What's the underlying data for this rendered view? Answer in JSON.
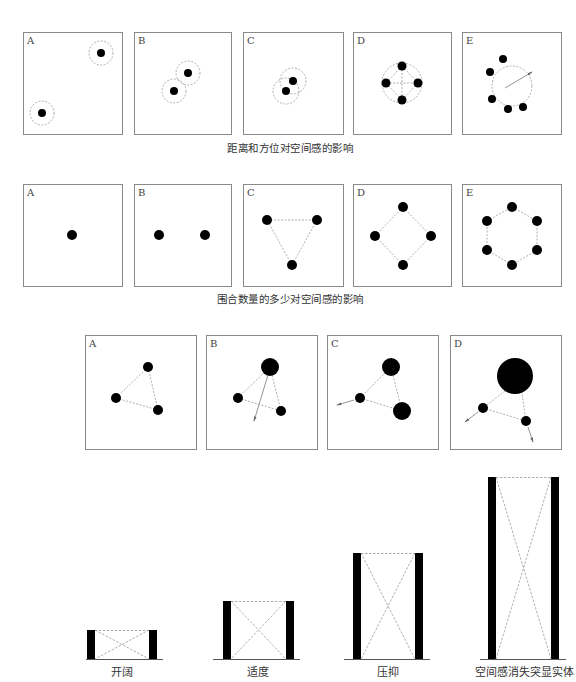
{
  "colors": {
    "frame": "#8a8a8a",
    "dot": "#000000",
    "dashed": "#9a9a9a",
    "text": "#333333"
  },
  "figure1": {
    "caption": "距离和方位对空间感的影响",
    "caption_pos": [
      290,
      147
    ],
    "panels": [
      {
        "label": "A",
        "box": [
          23,
          32,
          99,
          102
        ],
        "dots": [
          [
            101,
            53,
            4
          ],
          [
            42,
            113,
            4
          ]
        ],
        "circles": [
          [
            101,
            53,
            12
          ],
          [
            42,
            113,
            12
          ]
        ],
        "lines": [],
        "arrows": []
      },
      {
        "label": "B",
        "box": [
          134,
          32,
          97,
          102
        ],
        "dots": [
          [
            188,
            73,
            4
          ],
          [
            174,
            91,
            4
          ]
        ],
        "circles": [
          [
            188,
            73,
            12
          ],
          [
            174,
            91,
            12
          ]
        ],
        "lines": [],
        "arrows": []
      },
      {
        "label": "C",
        "box": [
          243,
          32,
          100,
          102
        ],
        "dots": [
          [
            293,
            81,
            4
          ],
          [
            286,
            91,
            4
          ]
        ],
        "circles": [
          [
            293,
            81,
            13
          ],
          [
            286,
            91,
            13
          ]
        ],
        "lines": [],
        "arrows": []
      },
      {
        "label": "D",
        "box": [
          353,
          32,
          98,
          102
        ],
        "dots": [
          [
            402,
            66,
            4.5
          ],
          [
            386,
            83,
            4.5
          ],
          [
            418,
            83,
            4.5
          ],
          [
            402,
            100,
            4.5
          ]
        ],
        "circles": [
          [
            402,
            83,
            20
          ]
        ],
        "lines": [
          [
            386,
            83,
            418,
            83
          ],
          [
            402,
            66,
            402,
            100
          ],
          [
            402,
            66,
            386,
            83
          ],
          [
            402,
            66,
            418,
            83
          ],
          [
            386,
            83,
            402,
            100
          ],
          [
            418,
            83,
            402,
            100
          ]
        ],
        "arrows": []
      },
      {
        "label": "E",
        "box": [
          462,
          32,
          99,
          102
        ],
        "dots": [
          [
            503,
            59,
            4
          ],
          [
            490,
            72,
            4
          ],
          [
            492,
            99,
            4
          ],
          [
            508,
            109,
            4
          ],
          [
            523,
            107,
            4
          ]
        ],
        "circles": [
          [
            512,
            86,
            20
          ]
        ],
        "lines": [],
        "arrows": [
          [
            505,
            88,
            532,
            72
          ]
        ]
      }
    ]
  },
  "figure2": {
    "caption": "围合数量的多少对空间感的影响",
    "caption_pos": [
      290,
      298
    ],
    "panels": [
      {
        "label": "A",
        "box": [
          23,
          184,
          99,
          102
        ],
        "dots": [
          [
            72,
            235,
            5
          ]
        ],
        "circles": [],
        "lines": [],
        "arrows": []
      },
      {
        "label": "B",
        "box": [
          134,
          184,
          97,
          102
        ],
        "dots": [
          [
            159,
            235,
            5
          ],
          [
            205,
            235,
            5
          ]
        ],
        "circles": [],
        "lines": [],
        "arrows": []
      },
      {
        "label": "C",
        "box": [
          243,
          184,
          100,
          102
        ],
        "dots": [
          [
            267,
            220,
            5
          ],
          [
            317,
            220,
            5
          ],
          [
            292,
            265,
            5
          ]
        ],
        "circles": [],
        "lines": [
          [
            267,
            220,
            317,
            220
          ],
          [
            317,
            220,
            292,
            265
          ],
          [
            292,
            265,
            267,
            220
          ]
        ],
        "arrows": []
      },
      {
        "label": "D",
        "box": [
          353,
          184,
          98,
          102
        ],
        "dots": [
          [
            403,
            207,
            5
          ],
          [
            375,
            236,
            5
          ],
          [
            431,
            236,
            5
          ],
          [
            403,
            265,
            5
          ]
        ],
        "circles": [],
        "lines": [
          [
            403,
            207,
            431,
            236
          ],
          [
            431,
            236,
            403,
            265
          ],
          [
            403,
            265,
            375,
            236
          ],
          [
            375,
            236,
            403,
            207
          ]
        ],
        "arrows": []
      },
      {
        "label": "E",
        "box": [
          462,
          184,
          99,
          102
        ],
        "dots": [
          [
            512,
            207,
            5
          ],
          [
            487,
            221,
            5
          ],
          [
            537,
            221,
            5
          ],
          [
            487,
            250,
            5
          ],
          [
            537,
            250,
            5
          ],
          [
            512,
            265,
            5
          ]
        ],
        "circles": [],
        "lines": [
          [
            512,
            207,
            537,
            221
          ],
          [
            537,
            221,
            537,
            250
          ],
          [
            537,
            250,
            512,
            265
          ],
          [
            512,
            265,
            487,
            250
          ],
          [
            487,
            250,
            487,
            221
          ],
          [
            487,
            221,
            512,
            207
          ]
        ],
        "arrows": []
      }
    ]
  },
  "figure3": {
    "panels": [
      {
        "label": "A",
        "box": [
          85,
          335,
          111,
          114
        ],
        "dots": [
          [
            148,
            367,
            5
          ],
          [
            116,
            398,
            5
          ],
          [
            158,
            410,
            5
          ]
        ],
        "circles": [],
        "lines": [
          [
            148,
            367,
            116,
            398
          ],
          [
            116,
            398,
            158,
            410
          ],
          [
            158,
            410,
            148,
            367
          ]
        ],
        "arrows": []
      },
      {
        "label": "B",
        "box": [
          206,
          335,
          111,
          114
        ],
        "dots": [
          [
            270,
            367,
            9
          ],
          [
            238,
            398,
            5
          ],
          [
            281,
            411,
            5
          ]
        ],
        "circles": [],
        "lines": [
          [
            270,
            367,
            238,
            398
          ],
          [
            238,
            398,
            281,
            411
          ],
          [
            281,
            411,
            270,
            367
          ]
        ],
        "arrows": [
          [
            268,
            375,
            254,
            421
          ]
        ]
      },
      {
        "label": "C",
        "box": [
          327,
          335,
          111,
          114
        ],
        "dots": [
          [
            391,
            367,
            9
          ],
          [
            360,
            398,
            5
          ],
          [
            402,
            411,
            9
          ]
        ],
        "circles": [],
        "lines": [
          [
            391,
            367,
            360,
            398
          ],
          [
            360,
            398,
            402,
            411
          ],
          [
            402,
            411,
            391,
            367
          ]
        ],
        "arrows": [
          [
            354,
            400,
            337,
            405
          ]
        ]
      },
      {
        "label": "D",
        "box": [
          450,
          335,
          111,
          114
        ],
        "dots": [
          [
            515,
            376,
            18
          ],
          [
            483,
            408,
            5
          ],
          [
            526,
            421,
            5
          ]
        ],
        "circles": [],
        "lines": [
          [
            505,
            391,
            483,
            408
          ],
          [
            483,
            408,
            526,
            421
          ],
          [
            526,
            421,
            522,
            393
          ]
        ],
        "arrows": [
          [
            478,
            412,
            465,
            422
          ],
          [
            528,
            427,
            533,
            442
          ]
        ]
      }
    ]
  },
  "figure4": {
    "ground_y": 659,
    "pillar_width": 8,
    "items": [
      {
        "label": "开阔",
        "label_pos": [
          122,
          672
        ],
        "left_x": 87,
        "right_x": 149,
        "top_y": 630,
        "ground": [
          86,
          163
        ]
      },
      {
        "label": "适度",
        "label_pos": [
          258,
          672
        ],
        "left_x": 223,
        "right_x": 286,
        "top_y": 601,
        "ground": [
          213,
          300
        ]
      },
      {
        "label": "压抑",
        "label_pos": [
          388,
          672
        ],
        "left_x": 353,
        "right_x": 415,
        "top_y": 553,
        "ground": [
          344,
          430
        ]
      },
      {
        "label": "空间感消失突显实体",
        "label_pos": [
          524,
          672
        ],
        "left_x": 488,
        "right_x": 551,
        "top_y": 477,
        "ground": [
          480,
          566
        ]
      }
    ]
  }
}
